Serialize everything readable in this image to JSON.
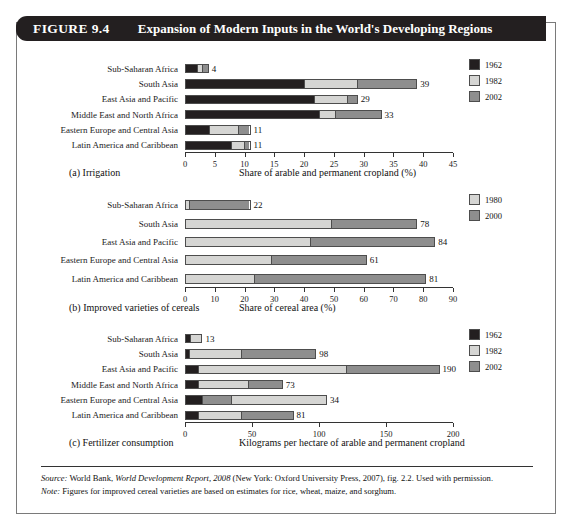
{
  "figure": {
    "number": "FIGURE 9.4",
    "title": "Expansion of Modern Inputs in the World's Developing Regions"
  },
  "colors": {
    "dark": "#231f20",
    "light": "#d5d5d3",
    "mid": "#8e8e8e",
    "outline": "#4d4d4d",
    "header_bg": "#231f20",
    "header_fg": "#ffffff"
  },
  "panels": [
    {
      "id": "a",
      "caption_left": "(a) Irrigation",
      "caption_right": "Share of arable and permanent cropland (%)",
      "legend": [
        {
          "label": "1962",
          "color_key": "dark"
        },
        {
          "label": "1982",
          "color_key": "light"
        },
        {
          "label": "2002",
          "color_key": "mid"
        }
      ],
      "axis": {
        "min": 0,
        "max": 45,
        "step": 5,
        "ticks": [
          "0",
          "5",
          "10",
          "15",
          "20",
          "25",
          "30",
          "35",
          "40",
          "45"
        ]
      },
      "rows": [
        {
          "label": "Sub-Saharan Africa",
          "total": "4",
          "segments": [
            2.0,
            0.9,
            1.1
          ]
        },
        {
          "label": "South Asia",
          "total": "39",
          "segments": [
            20.0,
            9.0,
            10.0
          ]
        },
        {
          "label": "East Asia and Pacific",
          "total": "29",
          "segments": [
            21.8,
            5.6,
            1.6
          ]
        },
        {
          "label": "Middle East and North Africa",
          "total": "33",
          "segments": [
            22.6,
            2.6,
            7.8
          ]
        },
        {
          "label": "Eastern Europe and Central Asia",
          "total": "11",
          "segments": [
            4.0,
            5.0,
            2.0
          ]
        },
        {
          "label": "Latin America and Caribbean",
          "total": "11",
          "segments": [
            7.8,
            2.2,
            1.0
          ]
        }
      ],
      "segment_order": [
        "dark",
        "light",
        "mid"
      ]
    },
    {
      "id": "b",
      "caption_left": "(b) Improved varieties of cereals",
      "caption_right": "Share of cereal area (%)",
      "legend": [
        {
          "label": "1980",
          "color_key": "light"
        },
        {
          "label": "2000",
          "color_key": "mid"
        }
      ],
      "axis": {
        "min": 0,
        "max": 90,
        "step": 10,
        "ticks": [
          "0",
          "10",
          "20",
          "30",
          "40",
          "50",
          "60",
          "70",
          "80",
          "90"
        ]
      },
      "rows": [
        {
          "label": "Sub-Saharan Africa",
          "total": "22",
          "segments": [
            1.0,
            21.0
          ]
        },
        {
          "label": "South Asia",
          "total": "78",
          "segments": [
            49.0,
            29.0
          ]
        },
        {
          "label": "East Asia and Pacific",
          "total": "84",
          "segments": [
            42.0,
            42.0
          ]
        },
        {
          "label": "Eastern Europe and Central Asia",
          "total": "61",
          "segments": [
            29.0,
            32.0
          ]
        },
        {
          "label": "Latin America and Caribbean",
          "total": "81",
          "segments": [
            23.0,
            58.0
          ]
        }
      ],
      "segment_order": [
        "light",
        "mid"
      ]
    },
    {
      "id": "c",
      "caption_left": "(c) Fertilizer consumption",
      "caption_right": "Kilograms per hectare of arable and permanent cropland",
      "legend": [
        {
          "label": "1962",
          "color_key": "dark"
        },
        {
          "label": "1982",
          "color_key": "light"
        },
        {
          "label": "2002",
          "color_key": "mid"
        }
      ],
      "axis": {
        "min": 0,
        "max": 200,
        "step": 50,
        "ticks": [
          "0",
          "50",
          "100",
          "150",
          "200"
        ]
      },
      "rows": [
        {
          "label": "Sub-Saharan Africa",
          "total": "13",
          "segments": [
            3.0,
            10.0
          ]
        },
        {
          "label": "South Asia",
          "total": "98",
          "segments": [
            2.0,
            40.0,
            56.0
          ]
        },
        {
          "label": "East Asia and Pacific",
          "total": "190",
          "segments": [
            9.0,
            111.0,
            70.0
          ]
        },
        {
          "label": "Middle East and North Africa",
          "total": "73",
          "segments": [
            9.0,
            38.0,
            26.0
          ]
        },
        {
          "label": "Eastern Europe and Central Asia",
          "total": "34",
          "segments": [
            12.0,
            22.0,
            72.0
          ]
        },
        {
          "label": "Latin America and Caribbean",
          "total": "81",
          "segments": [
            9.0,
            33.0,
            39.0
          ]
        }
      ],
      "segment_order": [
        "dark",
        "mid",
        "light"
      ],
      "segment_order_overrides": {
        "0": [
          "dark",
          "light"
        ],
        "1": [
          "dark",
          "light",
          "mid"
        ],
        "2": [
          "dark",
          "light",
          "mid"
        ],
        "3": [
          "dark",
          "light",
          "mid"
        ],
        "4": [
          "dark",
          "mid",
          "light"
        ],
        "5": [
          "dark",
          "light",
          "mid"
        ]
      }
    }
  ],
  "footer": {
    "source_label": "Source:",
    "source_text_1": " World Bank, ",
    "source_italic": "World Development Report, 2008",
    "source_text_2": " (New York: Oxford University Press, 2007), fig. 2.2. Used with permission.",
    "note_label": "Note:",
    "note_text": " Figures for improved cereal varieties are based on estimates for rice, wheat, maize, and sorghum."
  }
}
